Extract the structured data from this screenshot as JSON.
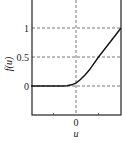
{
  "chart_data": {
    "type": "line",
    "title": "",
    "xlabel": "u",
    "ylabel": "f(u)",
    "xlim": [
      -1,
      1
    ],
    "ylim": [
      -0.5,
      1.5
    ],
    "x_ticks": [
      {
        "value": 0,
        "label": "0"
      }
    ],
    "x_minor_ticks": [
      -0.5,
      0.5
    ],
    "y_ticks": [
      {
        "value": 0,
        "label": "0"
      },
      {
        "value": 0.5,
        "label": "0.5"
      },
      {
        "value": 1,
        "label": "1"
      }
    ],
    "grid": true,
    "grid_style": "dashed",
    "legend": null,
    "series": [
      {
        "name": "f(u)",
        "color": "#111111",
        "x": [
          -1,
          -0.5,
          -0.3,
          -0.2,
          -0.1,
          0,
          0.1,
          0.2,
          0.3,
          0.5,
          0.75,
          1
        ],
        "y": [
          0,
          0,
          0,
          0.005,
          0.02,
          0.05,
          0.11,
          0.19,
          0.28,
          0.5,
          0.75,
          1
        ]
      }
    ]
  },
  "colors": {
    "axis": "#222222",
    "grid": "#555555",
    "curve": "#111111"
  }
}
